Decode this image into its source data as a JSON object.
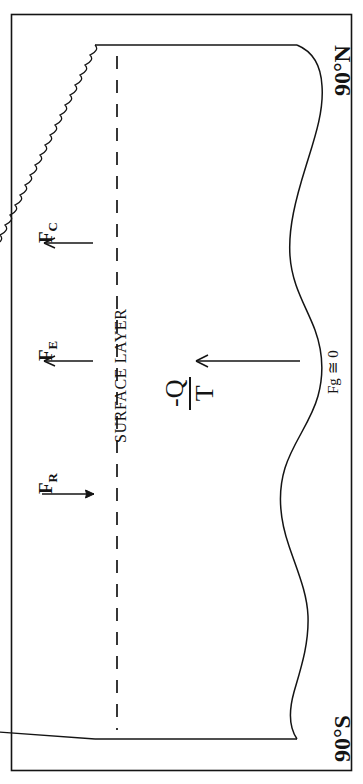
{
  "figure": {
    "type": "schematic-diagram",
    "latitude_labels": {
      "north": "90°N",
      "south": "90°S"
    },
    "region_label": "SURFACE LAYER",
    "center_label": {
      "numerator": "-Q",
      "denominator": "T",
      "plain": "-Q/T"
    },
    "arrows": [
      {
        "name": "radiative-flux",
        "label_main": "F",
        "label_sub": "R",
        "plain": "F_R",
        "direction": "into-surface-layer"
      },
      {
        "name": "evaporative-flux",
        "label_main": "F",
        "label_sub": "E",
        "plain": "F_E",
        "direction": "out-of-surface-layer"
      },
      {
        "name": "conductive-flux",
        "label_main": "F",
        "label_sub": "C",
        "plain": "F_C",
        "direction": "out-of-surface-layer"
      },
      {
        "name": "geothermal-flux",
        "label": "Fg ≅ 0",
        "plain": "Fg = 0",
        "direction": "toward-surface"
      }
    ],
    "colors": {
      "line": "#141414",
      "background": "#ffffff",
      "text": "#141414"
    },
    "elements": {
      "outer_border": "rectangle frame",
      "surface_boundary": "high-frequency wavy vertical line",
      "dashed_divider": "dashed vertical line",
      "atmosphere_top": "smooth large-amplitude wavy curve"
    }
  }
}
